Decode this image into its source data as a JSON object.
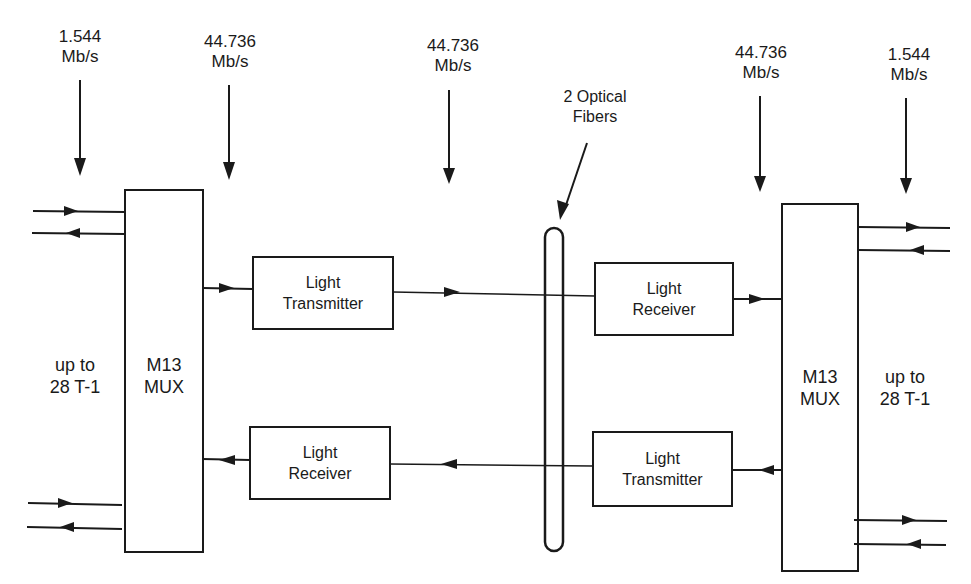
{
  "diagram": {
    "page_number_fragment": "...193",
    "rate_labels": [
      {
        "value": "1.544",
        "unit": "Mb/s"
      },
      {
        "value": "44.736",
        "unit": "Mb/s"
      },
      {
        "value": "44.736",
        "unit": "Mb/s"
      },
      {
        "value": "44.736",
        "unit": "Mb/s"
      },
      {
        "value": "1.544",
        "unit": "Mb/s"
      }
    ],
    "fiber_label": {
      "line1": "2 Optical",
      "line2": "Fibers"
    },
    "left_mux": {
      "line1": "M13",
      "line2": "MUX"
    },
    "right_mux": {
      "line1": "M13",
      "line2": "MUX"
    },
    "left_tributary": {
      "line1": "up to",
      "line2": "28 T-1"
    },
    "right_tributary": {
      "line1": "up to",
      "line2": "28 T-1"
    },
    "top_left_block": {
      "line1": "Light",
      "line2": "Transmitter"
    },
    "top_right_block": {
      "line1": "Light",
      "line2": "Receiver"
    },
    "bottom_left_block": {
      "line1": "Light",
      "line2": "Receiver"
    },
    "bottom_right_block": {
      "line1": "Light",
      "line2": "Transmitter"
    }
  }
}
